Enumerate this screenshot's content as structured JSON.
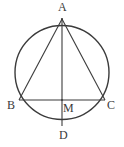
{
  "figure": {
    "type": "geometry-diagram",
    "background_color": "#ffffff",
    "stroke_color": "#3b3b3b",
    "labels": {
      "A": "A",
      "B": "B",
      "C": "C",
      "D": "D",
      "M": "M"
    },
    "points": {
      "A": {
        "x": 62,
        "y": 19,
        "role": "top-of-circle apex of triangle"
      },
      "B": {
        "x": 19,
        "y": 100,
        "role": "left end of chord BC on circle"
      },
      "C": {
        "x": 105,
        "y": 100,
        "role": "right end of chord BC on circle"
      },
      "D": {
        "x": 62,
        "y": 126,
        "role": "bottom-of-circle end of chord AD"
      },
      "M": {
        "x": 62,
        "y": 100,
        "role": "intersection of BC and AD"
      }
    },
    "circle": {
      "center_x": 62,
      "center_y": 72.5,
      "radius": 47,
      "stroke_width": 1.4
    },
    "segments": [
      {
        "name": "AB",
        "from": "A",
        "to": "B"
      },
      {
        "name": "AC",
        "from": "A",
        "to": "C"
      },
      {
        "name": "BC",
        "from": "B",
        "to": "C"
      },
      {
        "name": "AD",
        "from": "A",
        "to": "D"
      }
    ]
  }
}
